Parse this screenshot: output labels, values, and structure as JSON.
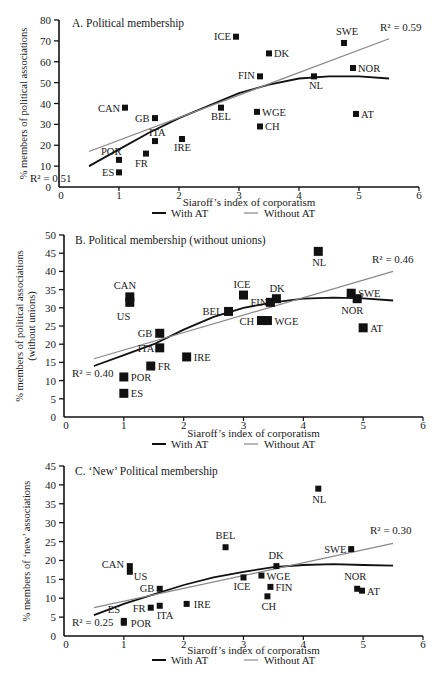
{
  "figure": {
    "x_label": "Siaroff’s index of corporatism",
    "legend": [
      {
        "label": "With AT",
        "color": "#111111",
        "width": 2
      },
      {
        "label": "Without AT",
        "color": "#888888",
        "width": 1.2
      }
    ]
  },
  "chart_data": [
    {
      "type": "scatter",
      "title": "A. Political membership",
      "xlabel": "Siaroff’s index of corporatism",
      "ylabel": "% members of political associations",
      "xlim": [
        0,
        6
      ],
      "ylim": [
        0,
        80
      ],
      "x_ticks": [
        0,
        1,
        2,
        3,
        4,
        5,
        6
      ],
      "y_ticks": [
        0,
        10,
        20,
        30,
        40,
        50,
        60,
        70,
        80
      ],
      "grid": false,
      "legend_position": "bottom",
      "points": [
        {
          "label": "ICE",
          "x": 2.95,
          "y": 72
        },
        {
          "label": "SWE",
          "x": 4.75,
          "y": 69
        },
        {
          "label": "DK",
          "x": 3.5,
          "y": 64
        },
        {
          "label": "NOR",
          "x": 4.9,
          "y": 57
        },
        {
          "label": "FIN",
          "x": 3.35,
          "y": 53
        },
        {
          "label": "NL",
          "x": 4.25,
          "y": 53
        },
        {
          "label": "CAN",
          "x": 1.1,
          "y": 38
        },
        {
          "label": "BEL",
          "x": 2.7,
          "y": 38
        },
        {
          "label": "WGE",
          "x": 3.3,
          "y": 36
        },
        {
          "label": "AT",
          "x": 4.95,
          "y": 35
        },
        {
          "label": "GB",
          "x": 1.6,
          "y": 33
        },
        {
          "label": "CH",
          "x": 3.35,
          "y": 29
        },
        {
          "label": "ITA",
          "x": 1.6,
          "y": 22
        },
        {
          "label": "IRE",
          "x": 2.05,
          "y": 23
        },
        {
          "label": "FR",
          "x": 1.45,
          "y": 16
        },
        {
          "label": "POR",
          "x": 1.0,
          "y": 13
        },
        {
          "label": "ES",
          "x": 1.0,
          "y": 7
        }
      ],
      "series": [
        {
          "name": "With AT",
          "type": "polynomial",
          "r2": 0.51,
          "r2_label": "R² = 0.51",
          "x": [
            0.5,
            1.0,
            1.5,
            2.0,
            2.5,
            3.0,
            3.5,
            4.0,
            4.5,
            5.0,
            5.5
          ],
          "values": [
            10,
            18,
            26,
            33,
            39,
            45,
            49,
            52,
            53,
            53,
            52
          ]
        },
        {
          "name": "Without AT",
          "type": "linear",
          "r2": 0.59,
          "r2_label": "R² = 0.59",
          "x": [
            0.5,
            5.5
          ],
          "values": [
            17,
            71
          ]
        }
      ]
    },
    {
      "type": "scatter",
      "title": "B.  Political membership (without unions)",
      "xlabel": "Siaroff’s index of corporatism",
      "ylabel": "% members of political associations (without unions)",
      "xlim": [
        0,
        6
      ],
      "ylim": [
        0,
        50
      ],
      "x_ticks": [
        0,
        1,
        2,
        3,
        4,
        5,
        6
      ],
      "y_ticks": [
        0,
        5,
        10,
        15,
        20,
        25,
        30,
        35,
        40,
        45,
        50
      ],
      "grid": false,
      "legend_position": "bottom",
      "points": [
        {
          "label": "NL",
          "x": 4.25,
          "y": 45.5
        },
        {
          "label": "SWE",
          "x": 4.8,
          "y": 34
        },
        {
          "label": "ICE",
          "x": 3.0,
          "y": 33.5
        },
        {
          "label": "CAN",
          "x": 1.1,
          "y": 33
        },
        {
          "label": "DK",
          "x": 3.55,
          "y": 32.5
        },
        {
          "label": "NOR",
          "x": 4.9,
          "y": 32.5
        },
        {
          "label": "US",
          "x": 1.1,
          "y": 31.5
        },
        {
          "label": "FIN",
          "x": 3.45,
          "y": 31.5
        },
        {
          "label": "BEL",
          "x": 2.75,
          "y": 29
        },
        {
          "label": "CH",
          "x": 3.3,
          "y": 26.5
        },
        {
          "label": "WGE",
          "x": 3.4,
          "y": 26.5
        },
        {
          "label": "AT",
          "x": 5.0,
          "y": 24.5
        },
        {
          "label": "GB",
          "x": 1.6,
          "y": 23
        },
        {
          "label": "ITA",
          "x": 1.6,
          "y": 19
        },
        {
          "label": "IRE",
          "x": 2.05,
          "y": 16.5
        },
        {
          "label": "FR",
          "x": 1.45,
          "y": 14
        },
        {
          "label": "POR",
          "x": 1.0,
          "y": 11
        },
        {
          "label": "ES",
          "x": 1.0,
          "y": 6.5
        }
      ],
      "series": [
        {
          "name": "With AT",
          "type": "polynomial",
          "r2": 0.4,
          "r2_label": "R² = 0.40",
          "x": [
            0.5,
            1.0,
            1.5,
            2.0,
            2.5,
            3.0,
            3.5,
            4.0,
            4.5,
            5.0,
            5.5
          ],
          "values": [
            14,
            17,
            20,
            24,
            27.5,
            30,
            31.5,
            32.5,
            32.8,
            32.6,
            32
          ]
        },
        {
          "name": "Without AT",
          "type": "linear",
          "r2": 0.46,
          "r2_label": "R² = 0.46",
          "x": [
            0.5,
            5.5
          ],
          "values": [
            16,
            40
          ]
        }
      ]
    },
    {
      "type": "scatter",
      "title": "C. ‘New’ Political membership",
      "xlabel": "Siaroff’s index of corporatism",
      "ylabel": "% members of ‘new’ associations",
      "xlim": [
        0,
        6
      ],
      "ylim": [
        0,
        45
      ],
      "x_ticks": [
        0,
        1,
        2,
        3,
        4,
        5,
        6
      ],
      "y_ticks": [
        0,
        5,
        10,
        15,
        20,
        25,
        30,
        35,
        40,
        45
      ],
      "grid": false,
      "legend_position": "bottom",
      "points": [
        {
          "label": "NL",
          "x": 4.25,
          "y": 39
        },
        {
          "label": "BEL",
          "x": 2.7,
          "y": 23.5
        },
        {
          "label": "SWE",
          "x": 4.8,
          "y": 23
        },
        {
          "label": "DK",
          "x": 3.55,
          "y": 18.5
        },
        {
          "label": "CAN",
          "x": 1.1,
          "y": 18.5
        },
        {
          "label": "US",
          "x": 1.1,
          "y": 17
        },
        {
          "label": "WGE",
          "x": 3.3,
          "y": 16
        },
        {
          "label": "ICE",
          "x": 3.0,
          "y": 15.5
        },
        {
          "label": "FIN",
          "x": 3.45,
          "y": 13
        },
        {
          "label": "GB",
          "x": 1.6,
          "y": 12.5
        },
        {
          "label": "NOR",
          "x": 4.9,
          "y": 12.5
        },
        {
          "label": "AT",
          "x": 4.98,
          "y": 12
        },
        {
          "label": "CH",
          "x": 3.4,
          "y": 10.5
        },
        {
          "label": "IRE",
          "x": 2.05,
          "y": 8.5
        },
        {
          "label": "ITA",
          "x": 1.6,
          "y": 8
        },
        {
          "label": "FR",
          "x": 1.45,
          "y": 7.5
        },
        {
          "label": "ES",
          "x": 1.0,
          "y": 4
        },
        {
          "label": "POR",
          "x": 1.0,
          "y": 3.5
        }
      ],
      "series": [
        {
          "name": "With AT",
          "type": "polynomial",
          "r2": 0.25,
          "r2_label": "R² = 0.25",
          "x": [
            0.5,
            1.0,
            1.5,
            2.0,
            2.5,
            3.0,
            3.5,
            4.0,
            4.5,
            5.0,
            5.5
          ],
          "values": [
            5.5,
            8.5,
            11,
            13.5,
            15.5,
            17,
            18.2,
            18.8,
            19,
            18.8,
            18.6
          ]
        },
        {
          "name": "Without AT",
          "type": "linear",
          "r2": 0.3,
          "r2_label": "R² = 0.30",
          "x": [
            0.5,
            5.5
          ],
          "values": [
            7.5,
            24.5
          ]
        }
      ]
    }
  ],
  "layout": {
    "panels": [
      {
        "x0": 59,
        "x6": 419,
        "y_zero": 187,
        "y_top": 20,
        "title_pos": [
          72,
          27
        ],
        "r2_with_pos": [
          30,
          182
        ],
        "r2_without_pos": [
          380,
          31
        ],
        "legend_y": 217,
        "xlabel_y": 206,
        "ylabel_x": 27,
        "label_offsets": {
          "ICE": [
            -22,
            3
          ],
          "SWE": [
            -8,
            -8
          ],
          "DK": [
            5,
            4
          ],
          "NOR": [
            5,
            4
          ],
          "FIN": [
            -22,
            3
          ],
          "NL": [
            -5,
            13
          ],
          "CAN": [
            -27,
            4
          ],
          "BEL": [
            -10,
            12
          ],
          "WGE": [
            5,
            4
          ],
          "AT": [
            5,
            4
          ],
          "GB": [
            -20,
            4
          ],
          "CH": [
            5,
            4
          ],
          "ITA": [
            -6,
            -5
          ],
          "IRE": [
            -8,
            12
          ],
          "FR": [
            -11,
            13
          ],
          "POR": [
            -18,
            -5
          ],
          "ES": [
            -17,
            4
          ]
        }
      },
      {
        "x0": 64,
        "x6": 423,
        "y_zero": 417,
        "y_top": 235,
        "title_pos": [
          75,
          244
        ],
        "r2_with_pos": [
          72,
          377
        ],
        "r2_without_pos": [
          372,
          263
        ],
        "legend_y": 448,
        "xlabel_y": 437,
        "ylabel_x": 27,
        "label_offsets": {
          "NL": [
            -6,
            15
          ],
          "SWE": [
            7,
            4
          ],
          "ICE": [
            -10,
            -7
          ],
          "CAN": [
            -16,
            -8
          ],
          "DK": [
            -7,
            -7
          ],
          "NOR": [
            -16,
            15
          ],
          "US": [
            -13,
            18
          ],
          "FIN": [
            -20,
            4
          ],
          "BEL": [
            -26,
            4
          ],
          "CH": [
            -22,
            4
          ],
          "WGE": [
            7,
            4
          ],
          "AT": [
            7,
            4
          ],
          "GB": [
            -22,
            4
          ],
          "ITA": [
            -22,
            4
          ],
          "IRE": [
            7,
            4
          ],
          "FR": [
            7,
            4
          ],
          "POR": [
            7,
            4
          ],
          "ES": [
            7,
            4
          ]
        }
      },
      {
        "x0": 64,
        "x6": 423,
        "y_zero": 636,
        "y_top": 466,
        "title_pos": [
          75,
          475
        ],
        "r2_with_pos": [
          72,
          626
        ],
        "r2_without_pos": [
          370,
          534
        ],
        "legend_y": 664,
        "xlabel_y": 654,
        "ylabel_x": 30,
        "label_offsets": {
          "NL": [
            -6,
            14
          ],
          "BEL": [
            -10,
            -8
          ],
          "SWE": [
            -27,
            4
          ],
          "DK": [
            -8,
            -7
          ],
          "CAN": [
            -28,
            2
          ],
          "US": [
            4,
            8
          ],
          "WGE": [
            5,
            4
          ],
          "ICE": [
            -10,
            13
          ],
          "FIN": [
            5,
            4
          ],
          "GB": [
            -20,
            3
          ],
          "NOR": [
            -13,
            -9
          ],
          "AT": [
            5,
            4
          ],
          "CH": [
            -6,
            14
          ],
          "IRE": [
            7,
            4
          ],
          "ITA": [
            -3,
            13
          ],
          "FR": [
            -18,
            4
          ],
          "ES": [
            -16,
            -8
          ],
          "POR": [
            7,
            4
          ]
        }
      }
    ]
  }
}
